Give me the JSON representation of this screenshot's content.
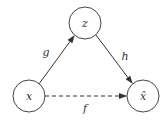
{
  "diagram": {
    "type": "directed-graph",
    "nodes": [
      {
        "id": "x",
        "label": "x",
        "cx": 29,
        "cy": 96,
        "r": 16
      },
      {
        "id": "z",
        "label": "z",
        "cx": 85,
        "cy": 23,
        "r": 16
      },
      {
        "id": "xhat",
        "label": "x̂",
        "cx": 143,
        "cy": 96,
        "r": 16
      }
    ],
    "edges": [
      {
        "from": "x",
        "to": "z",
        "label": "g",
        "style": "solid"
      },
      {
        "from": "z",
        "to": "xhat",
        "label": "h",
        "style": "solid"
      },
      {
        "from": "x",
        "to": "xhat",
        "label": "f",
        "style": "dashed"
      }
    ],
    "colors": {
      "stroke": "#444444",
      "text": "#333333",
      "background": "#ffffff"
    }
  }
}
